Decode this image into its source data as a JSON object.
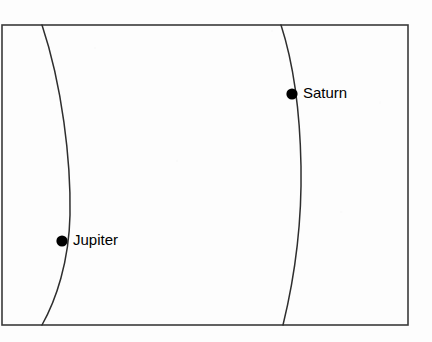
{
  "figure": {
    "background_color": "#fdfdfd",
    "line_color": "#3a3a3a",
    "curve_color": "#2e2e2e",
    "marker_color": "#000000",
    "label_color": "#000000"
  },
  "frame": {
    "left": 2,
    "top": 25,
    "right": 408,
    "bottom": 325
  },
  "chart_data": {
    "type": "scatter",
    "title": "",
    "subtitle": "",
    "xlabel": "",
    "ylabel": "",
    "grid": false,
    "legend_position": "none",
    "annotations": [
      "Jupiter",
      "Saturn"
    ],
    "curves": [
      {
        "name": "jupiter-orbit-arc",
        "path": "M 42 25 C 62 85, 71 160, 70 215 C 69 262, 56 300, 42 325"
      },
      {
        "name": "saturn-orbit-arc",
        "path": "M 281 25 C 293 62, 300 112, 301 166 C 302 222, 294 280, 283 325"
      }
    ],
    "points": [
      {
        "label": "Jupiter",
        "x": 62,
        "y": 241,
        "radius": 5.6,
        "label_x": 73,
        "label_y": 241
      },
      {
        "label": "Saturn",
        "x": 292,
        "y": 94,
        "radius": 5.6,
        "label_x": 303,
        "label_y": 94
      }
    ]
  },
  "labels": {
    "jupiter": "Jupiter",
    "saturn": "Saturn"
  }
}
